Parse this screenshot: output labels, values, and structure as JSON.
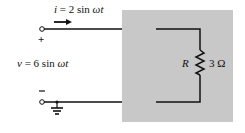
{
  "diagram": {
    "current_label": {
      "var": "i",
      "eq": " = 2 sin ",
      "omega": "ωt"
    },
    "voltage_label": {
      "var": "v",
      "eq": " = 6 sin ",
      "omega": "ωt"
    },
    "plus_sign": "+",
    "minus_sign": "–",
    "resistor": {
      "name": "R",
      "value": "3 Ω"
    },
    "colors": {
      "box": "#c8c8c8",
      "wire": "#111111",
      "background": "#ffffff"
    }
  }
}
